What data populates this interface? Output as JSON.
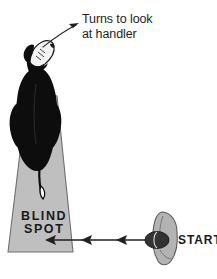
{
  "figure": {
    "width": 217,
    "height": 279,
    "background_color": "#ffffff"
  },
  "annotation": {
    "line1": "Turns to look",
    "line2": "at handler",
    "text_color": "#231f20",
    "pointer": "curved-arrow-from-dog-head"
  },
  "blind_spot": {
    "label_line1": "BLIND",
    "label_line2": "SPOT",
    "fill_color": "#bfbfbf",
    "stroke_color": "#6e6e6e"
  },
  "start_marker": {
    "label": "START",
    "handler_color": "#b3b3b3",
    "handler_stroke": "#5c5c5c",
    "dog_head_color": "#333333"
  },
  "dog": {
    "body_color": "#0d0d0d",
    "muzzle_color": "#f2f2f2",
    "tail_tip_color": "#ffffff"
  },
  "sight_arrow": {
    "color": "#231f20",
    "direction": "right-to-left",
    "arrowhead_count": 3
  }
}
